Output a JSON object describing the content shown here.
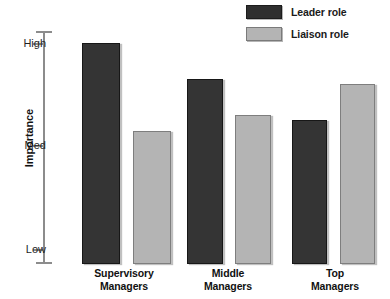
{
  "chart_data": {
    "type": "bar",
    "title": "",
    "subtitle": "",
    "xlabel": "",
    "ylabel": "Importance",
    "grid": false,
    "legend_position": "top-right",
    "categories": [
      "Supervisory Managers",
      "Middle Managers",
      "Top Managers"
    ],
    "category_lines": [
      [
        "Supervisory",
        "Managers"
      ],
      [
        "Middle",
        "Managers"
      ],
      [
        "Top",
        "Managers"
      ]
    ],
    "y_tick_labels": [
      "High",
      "Med",
      "Low"
    ],
    "y_tick_values": [
      3,
      2,
      1
    ],
    "ylim": [
      1,
      3
    ],
    "series": [
      {
        "name": "Leader role",
        "color": "#343434",
        "values": [
          3.0,
          2.65,
          2.25
        ]
      },
      {
        "name": "Liaison role",
        "color": "#b4b4b4",
        "values": [
          2.15,
          2.3,
          2.6
        ]
      }
    ]
  },
  "legend": {
    "items": [
      {
        "label": "Leader role"
      },
      {
        "label": "Liaison role"
      }
    ]
  },
  "axis": {
    "y_title": "Importance",
    "ticks": [
      {
        "label": "High"
      },
      {
        "label": "Med"
      },
      {
        "label": "Low"
      }
    ]
  }
}
